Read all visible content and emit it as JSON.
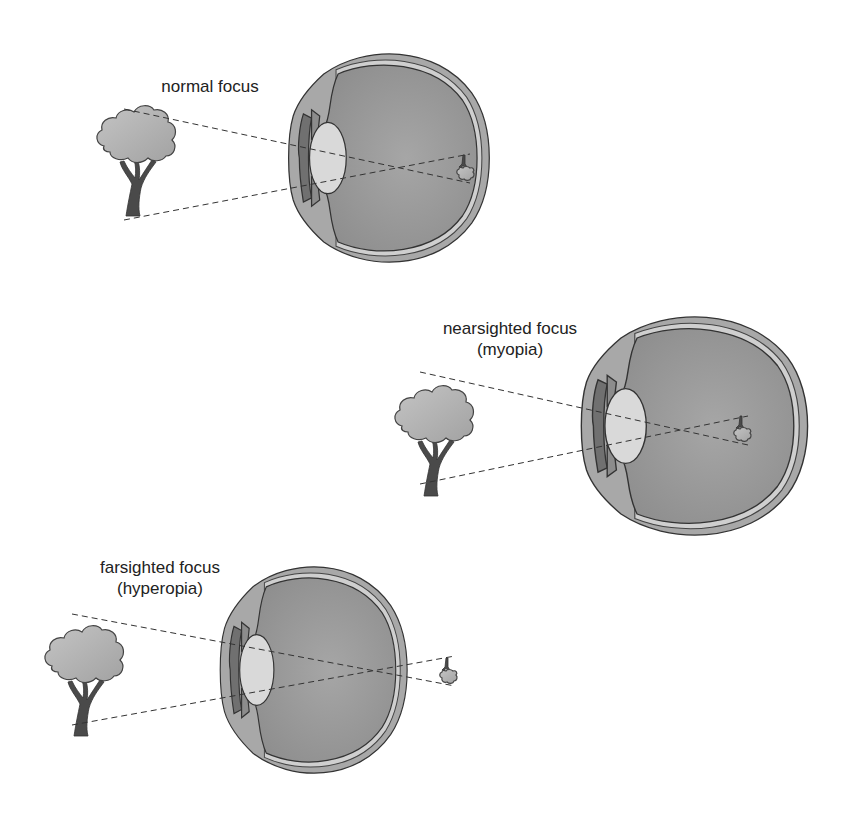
{
  "panels": [
    {
      "id": "normal",
      "label_lines": [
        "normal focus"
      ],
      "description": "Image focused on retina"
    },
    {
      "id": "nearsighted",
      "label_lines": [
        "nearsighted focus",
        "(myopia)"
      ],
      "description": "Image focused in front of retina"
    },
    {
      "id": "farsighted",
      "label_lines": [
        "farsighted focus",
        "(hyperopia)"
      ],
      "description": "Image focused behind retina"
    }
  ],
  "colors": {
    "background": "#ffffff",
    "eye_outer": "#a8a8a8",
    "vitreous": "#9a9a9a",
    "lens": "#d9d9d9",
    "tree_canopy": "#b0b0b0",
    "tree_trunk": "#4a4a4a",
    "ray_line": "#333333"
  }
}
